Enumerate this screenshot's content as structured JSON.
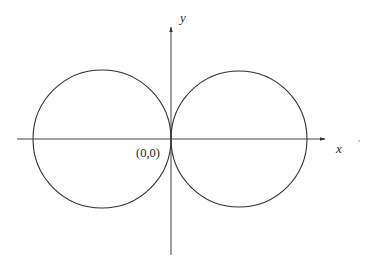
{
  "figure": {
    "type": "polar-curve-plot",
    "axes": {
      "x_label": "x",
      "y_label": "y",
      "origin_label": "(0,0)"
    },
    "colors": {
      "background": "#ffffff",
      "stroke": "#333333",
      "text": "#2a2a2a"
    },
    "curves": [
      {
        "name": "left-circle",
        "center": [
          -1,
          0
        ],
        "radius": 1
      },
      {
        "name": "right-circle",
        "center": [
          1,
          0
        ],
        "radius": 1
      }
    ]
  }
}
